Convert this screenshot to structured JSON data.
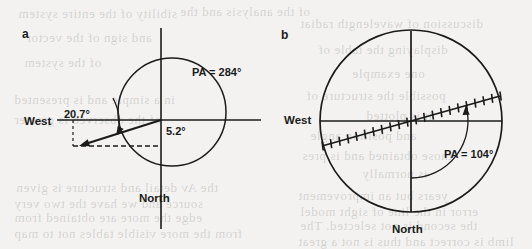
{
  "figure": {
    "width": 532,
    "height": 249,
    "background_color": "#f3f2f0",
    "ink_color": "#1b1b1b",
    "panels": [
      {
        "id": "a",
        "label": "a",
        "label_x": 22,
        "label_y": 27,
        "axes": {
          "origin_x": 161,
          "origin_y": 120,
          "horizontal_x1": 57,
          "horizontal_x2": 261,
          "vertical_y1": 28,
          "vertical_y2": 229,
          "west_label": "West",
          "west_label_x": 24,
          "west_label_y": 115,
          "north_label": "North",
          "north_label_x": 139,
          "north_label_y": 192
        },
        "circle": {
          "cx": 172,
          "cy": 112,
          "r": 54
        },
        "vector": {
          "tip_x": 79,
          "tip_y": 146,
          "dashed_horizontal_x1": 73,
          "dashed_horizontal_x2": 161,
          "dashed_vertical_y1": 120,
          "dashed_vertical_y2": 146
        },
        "annotations": [
          {
            "name": "angle-20-7",
            "text": "20.7°",
            "x": 64,
            "y": 108
          },
          {
            "name": "angle-5-2",
            "text": "5.2°",
            "x": 166,
            "y": 125
          },
          {
            "name": "position-angle",
            "text": "PA = 284°",
            "x": 192,
            "y": 66
          }
        ]
      },
      {
        "id": "b",
        "label": "b",
        "label_x": 281,
        "label_y": 28,
        "axes": {
          "origin_x": 411,
          "origin_y": 121,
          "horizontal_x1": 320,
          "horizontal_x2": 502,
          "vertical_y1": 31,
          "vertical_y2": 212,
          "west_label": "West",
          "west_label_x": 284,
          "west_label_y": 114,
          "north_label": "North",
          "north_label_x": 392,
          "north_label_y": 223
        },
        "circle": {
          "cx": 411,
          "cy": 121,
          "r": 91
        },
        "ticked_line": {
          "x1": 322,
          "y1": 146,
          "x2": 500,
          "y2": 96,
          "tick_count": 22,
          "tick_length": 9
        },
        "annotations": [
          {
            "name": "position-angle",
            "text": "PA = 104°",
            "x": 444,
            "y": 148
          }
        ]
      }
    ]
  },
  "bleed_text": [
    {
      "text": "sibility of the entire system",
      "x": 18,
      "y": 6,
      "size": 13
    },
    {
      "text": "of the analysis and the",
      "x": 180,
      "y": 4,
      "size": 13
    },
    {
      "text": "discussion of wavelength radiat",
      "x": 300,
      "y": 16,
      "size": 13
    },
    {
      "text": "and sign of the vector",
      "x": 26,
      "y": 30,
      "size": 13
    },
    {
      "text": "displaying the table of",
      "x": 318,
      "y": 42,
      "size": 13
    },
    {
      "text": "of the system",
      "x": 24,
      "y": 55,
      "size": 13
    },
    {
      "text": "one example",
      "x": 352,
      "y": 66,
      "size": 13
    },
    {
      "text": "possible the structure of",
      "x": 306,
      "y": 88,
      "size": 13
    },
    {
      "text": "in a simple and is presented",
      "x": 14,
      "y": 92,
      "size": 13
    },
    {
      "text": "it is plotted",
      "x": 366,
      "y": 108,
      "size": 13
    },
    {
      "text": "of the observed is greater",
      "x": 14,
      "y": 112,
      "size": 13
    },
    {
      "text": "and position angle",
      "x": 310,
      "y": 128,
      "size": 13
    },
    {
      "text": "those obtained and is pres",
      "x": 302,
      "y": 148,
      "size": 13
    },
    {
      "text": "is normally",
      "x": 362,
      "y": 166,
      "size": 13
    },
    {
      "text": "the Av detail and structure is given",
      "x": 16,
      "y": 180,
      "size": 13
    },
    {
      "text": "years but an improvement",
      "x": 298,
      "y": 188,
      "size": 13
    },
    {
      "text": "source and we have the two very",
      "x": 14,
      "y": 196,
      "size": 13
    },
    {
      "text": "error in the line of sight model",
      "x": 300,
      "y": 204,
      "size": 13
    },
    {
      "text": "edge the more are obtained from",
      "x": 14,
      "y": 210,
      "size": 13
    },
    {
      "text": "the second is not selected. The",
      "x": 300,
      "y": 218,
      "size": 13
    },
    {
      "text": "from the more visible tables not to map",
      "x": 14,
      "y": 226,
      "size": 13
    },
    {
      "text": "limb is correct and thus is not a great",
      "x": 298,
      "y": 234,
      "size": 13
    }
  ]
}
